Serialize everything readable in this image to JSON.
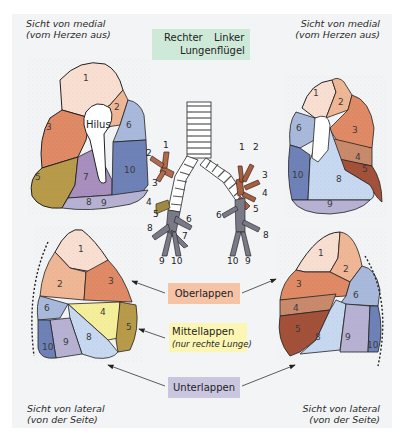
{
  "title": {
    "line1_left": "Rechter",
    "line1_right": "Linker",
    "line2": "Lungenflügel",
    "color": "#cfe9d9"
  },
  "views": {
    "top_left": {
      "line1": "Sicht von medial",
      "line2": "(vom Herzen aus)",
      "lung": "right",
      "hilus_label": "Hilus",
      "segments": [
        "1",
        "2",
        "3",
        "5",
        "6",
        "7",
        "8",
        "9",
        "10"
      ]
    },
    "top_right": {
      "line1": "Sicht von medial",
      "line2": "(vom Herzen aus)",
      "lung": "left",
      "segments": [
        "1",
        "2",
        "3",
        "4",
        "5",
        "6",
        "8",
        "9",
        "10"
      ]
    },
    "bottom_left": {
      "line1": "Sicht von lateral",
      "line2": "(von der Seite)",
      "lung": "right",
      "segments": [
        "1",
        "2",
        "3",
        "4",
        "5",
        "6",
        "8",
        "9",
        "10"
      ]
    },
    "bottom_right": {
      "line1": "Sicht von lateral",
      "line2": "(von der Seite)",
      "lung": "left",
      "segments": [
        "1",
        "2",
        "3",
        "4",
        "5",
        "6",
        "8",
        "9",
        "10"
      ]
    }
  },
  "bronchial_tree": {
    "right_labels": [
      "1",
      "2",
      "3",
      "4",
      "5",
      "6",
      "7",
      "8",
      "9",
      "10"
    ],
    "left_labels": [
      "1",
      "2",
      "3",
      "4",
      "5",
      "6",
      "8",
      "9",
      "10"
    ]
  },
  "lobes": {
    "upper": {
      "label": "Oberlappen",
      "color": "#f5c3a6"
    },
    "middle": {
      "label": "Mittellappen",
      "note": "(nur rechte Lunge)",
      "color": "#fcf6b4"
    },
    "lower": {
      "label": "Unterlappen",
      "color": "#cbc6e0"
    }
  },
  "segment_colors": {
    "s1": "#f9dfd1",
    "s2": "#f0b796",
    "s3": "#e08a66",
    "s4_right": "#f5ee9a",
    "s5_right": "#b89b4a",
    "s4_left": "#c98a6c",
    "s5_left": "#a4513a",
    "s6": "#a9b9dc",
    "s7": "#a88fbe",
    "s8": "#c7d8f1",
    "s9": "#b7b2d3",
    "s10": "#6f82b8"
  }
}
